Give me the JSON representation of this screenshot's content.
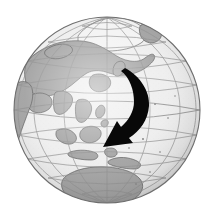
{
  "image": {
    "title": "Globe with curved arrow",
    "width": 215,
    "height": 223,
    "background_color": "#ffffff",
    "style": "grayscale halftone illustration"
  },
  "globe": {
    "name": "earth-globe",
    "center_x": 107,
    "center_y": 110,
    "radius": 93,
    "ocean_color": "#ededed",
    "land_color": "#9d9d9d",
    "coastline_color": "#4a4a4a",
    "graticule_color": "#8c8c8c",
    "limb_color": "#6e6e6e",
    "projection": "orthographic",
    "center_view": "Asia-Pacific",
    "rim_shadow_color": "#b5b5b5"
  },
  "graticule": {
    "name": "lat-long-grid",
    "meridian_count": 12,
    "parallel_count": 11,
    "meridian_spacing_degrees": 30,
    "parallel_spacing_degrees": 20,
    "visible": true
  },
  "landmasses": [
    {
      "name": "arctic-north-pole",
      "label": "Arctic"
    },
    {
      "name": "eurasia",
      "label": "Eurasia"
    },
    {
      "name": "africa",
      "label": "Africa"
    },
    {
      "name": "arabia-india",
      "label": "Arabia and India"
    },
    {
      "name": "southeast-asia",
      "label": "Southeast Asia"
    },
    {
      "name": "indonesia",
      "label": "Indonesia"
    },
    {
      "name": "philippines",
      "label": "Philippines"
    },
    {
      "name": "japan",
      "label": "Japan"
    },
    {
      "name": "new-guinea",
      "label": "New Guinea"
    },
    {
      "name": "australia",
      "label": "Australia"
    },
    {
      "name": "greenland",
      "label": "Greenland"
    }
  ],
  "arrow": {
    "name": "curved-direction-arrow",
    "color": "#000000",
    "start_x": 125,
    "start_y": 69,
    "end_x": 104,
    "end_y": 146,
    "direction": "curves from northeast Asia southeastward then southwest toward Australia",
    "style": "tapered curved arrow with solid arrowhead"
  }
}
